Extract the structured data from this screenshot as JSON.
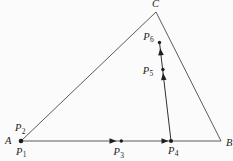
{
  "canvas": {
    "width": 233,
    "height": 161,
    "background": "#fbfbfb"
  },
  "colors": {
    "edge": "#4a4a4a",
    "path": "#303030",
    "ink": "#1d1d1d"
  },
  "triangle": {
    "vertices": {
      "A": {
        "x": 21,
        "y": 141
      },
      "B": {
        "x": 221,
        "y": 141
      },
      "C": {
        "x": 156,
        "y": 12
      }
    },
    "edge_width": 0.9,
    "labels": [
      {
        "text": "A",
        "x": 5,
        "y": 144
      },
      {
        "text": "B",
        "x": 226,
        "y": 145.5
      },
      {
        "text": "C",
        "x": 152,
        "y": 6.5
      }
    ]
  },
  "inner_segment": {
    "x1": 171,
    "y1": 141,
    "x2": 159.5,
    "y2": 42.5,
    "width": 1
  },
  "points": [
    {
      "label": "P",
      "sub": "1",
      "has_dot": true,
      "x": 21,
      "y": 141,
      "r": 2.3,
      "label_x": 16,
      "label_y": 154.5
    },
    {
      "label": "P",
      "sub": "2",
      "has_dot": false,
      "label_x": 15,
      "label_y": 131
    },
    {
      "label": "P",
      "sub": "3",
      "has_dot": true,
      "x": 121.3,
      "y": 141,
      "r": 1.7,
      "label_x": 113.5,
      "label_y": 155
    },
    {
      "label": "P",
      "sub": "4",
      "has_dot": true,
      "x": 171,
      "y": 141,
      "r": 2.0,
      "label_x": 168,
      "label_y": 153.5
    },
    {
      "label": "P",
      "sub": "5",
      "has_dot": true,
      "x": 162.9,
      "y": 69.5,
      "r": 1.7,
      "label_x": 142.7,
      "label_y": 73.5
    },
    {
      "label": "P",
      "sub": "6",
      "has_dot": true,
      "x": 159.5,
      "y": 42.5,
      "r": 1.7,
      "label_x": 143.3,
      "label_y": 39.5
    }
  ],
  "arrows": [
    {
      "tip_x": 116.5,
      "tip_y": 141,
      "angle": 0,
      "len": 7,
      "half_w": 2.8
    },
    {
      "tip_x": 168.5,
      "tip_y": 141,
      "angle": 0,
      "len": 7,
      "half_w": 2.8
    },
    {
      "tip_x": 163.0,
      "tip_y": 73.0,
      "angle": -96.7,
      "len": 7,
      "half_w": 2.8
    },
    {
      "tip_x": 160.2,
      "tip_y": 48.3,
      "angle": -96.7,
      "len": 7,
      "half_w": 2.8
    }
  ]
}
